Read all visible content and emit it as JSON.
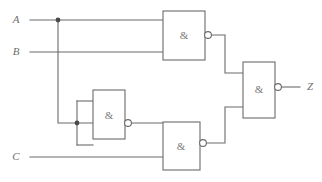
{
  "figure": {
    "name": "nand-logic-circuit",
    "width": 322,
    "height": 182,
    "background_color": "#ffffff",
    "line_color": "#6b6b6b",
    "label_color": "#6e6e6e"
  },
  "inputs": [
    {
      "id": "A",
      "label": "A",
      "label_x": 16,
      "label_y": 20,
      "wire_y": 20
    },
    {
      "id": "B",
      "label": "B",
      "label_x": 16,
      "label_y": 52,
      "wire_y": 52
    },
    {
      "id": "C",
      "label": "C",
      "label_x": 16,
      "label_y": 157,
      "wire_y": 157
    }
  ],
  "outputs": [
    {
      "id": "Z",
      "label": "Z",
      "label_x": 310,
      "label_y": 87,
      "wire_y": 87
    }
  ],
  "gates": [
    {
      "id": "G1",
      "type": "nand",
      "symbol": "&",
      "x": 163,
      "y": 11,
      "width": 42,
      "height": 49,
      "bubble_cx": 208,
      "bubble_cy": 35,
      "bubble_r": 3.4,
      "label_x": 184,
      "label_y": 36,
      "inputs": [
        "A",
        "B"
      ],
      "output_y": 35
    },
    {
      "id": "G2",
      "type": "nand",
      "symbol": "&",
      "x": 93,
      "y": 90,
      "width": 32,
      "height": 49,
      "bubble_cx": 128,
      "bubble_cy": 123,
      "bubble_r": 3.4,
      "label_x": 109,
      "label_y": 116,
      "inputs": [
        "A",
        "A"
      ],
      "output_y": 123
    },
    {
      "id": "G3",
      "type": "nand",
      "symbol": "&",
      "x": 163,
      "y": 122,
      "width": 37,
      "height": 48,
      "bubble_cx": 203,
      "bubble_cy": 143,
      "bubble_r": 3.4,
      "label_x": 181,
      "label_y": 147,
      "inputs": [
        "G2",
        "C"
      ],
      "output_y": 143
    },
    {
      "id": "G4",
      "type": "nand",
      "symbol": "&",
      "x": 243,
      "y": 62,
      "width": 32,
      "height": 56,
      "bubble_cx": 278,
      "bubble_cy": 87,
      "bubble_r": 3.4,
      "label_x": 259,
      "label_y": 90,
      "inputs": [
        "G1",
        "G3"
      ],
      "output_y": 87
    }
  ],
  "junctions": [
    {
      "id": "A-branch",
      "cx": 58,
      "cy": 20,
      "r": 2.4
    },
    {
      "id": "G2-input-tie",
      "cx": 77,
      "cy": 123,
      "r": 2.4
    }
  ],
  "wires": [
    {
      "id": "wire-A-main",
      "d": "M 30 20 L 163 20"
    },
    {
      "id": "wire-B-main",
      "d": "M 30 52 L 163 52"
    },
    {
      "id": "wire-A-drop",
      "d": "M 58 20 L 58 123 L 93 123"
    },
    {
      "id": "wire-G2-tie-upper",
      "d": "M 77 101 L 93 101"
    },
    {
      "id": "wire-G2-tie-lower",
      "d": "M 77 145 L 93 145"
    },
    {
      "id": "wire-G2-tie-bar",
      "d": "M 77 101 L 77 145"
    },
    {
      "id": "wire-G2-out",
      "d": "M 131 123 L 163 123"
    },
    {
      "id": "wire-C-main",
      "d": "M 30 157 L 163 157"
    },
    {
      "id": "wire-G1-out",
      "d": "M 211 35 L 225 35 L 225 73 L 243 73"
    },
    {
      "id": "wire-G3-out",
      "d": "M 206 143 L 225 143 L 225 107 L 243 107"
    },
    {
      "id": "wire-Z-out",
      "d": "M 281 87 L 300 87"
    }
  ]
}
